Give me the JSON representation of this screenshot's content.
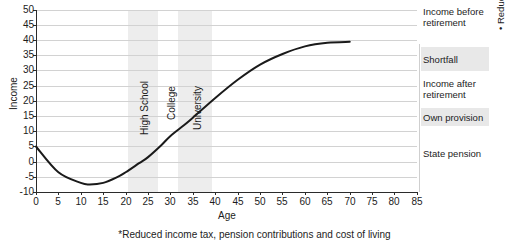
{
  "chart_data": {
    "type": "line",
    "title": "",
    "xlabel": "Age",
    "ylabel": "Income",
    "xlim": [
      0,
      85
    ],
    "ylim": [
      -10,
      50
    ],
    "xticks": [
      0,
      5,
      10,
      15,
      20,
      25,
      30,
      35,
      40,
      45,
      50,
      55,
      60,
      65,
      70,
      75,
      80,
      85
    ],
    "yticks": [
      -10,
      -5,
      0,
      5,
      10,
      15,
      20,
      25,
      30,
      35,
      40,
      45,
      50
    ],
    "grid": true,
    "legend_position": "right-outside",
    "series": [
      {
        "name": "Income over lifetime",
        "color": "#1a1a1a",
        "x": [
          0,
          5,
          10,
          12,
          15,
          18,
          20,
          23,
          25,
          28,
          30,
          33,
          35,
          40,
          45,
          50,
          55,
          60,
          65,
          70
        ],
        "y": [
          5.0,
          -3.5,
          -7.0,
          -7.5,
          -7.0,
          -5.2,
          -3.5,
          -0.5,
          1.5,
          5.5,
          8.5,
          12.0,
          14.5,
          21.0,
          27.0,
          32.0,
          35.5,
          38.0,
          39.2,
          39.5
        ]
      }
    ],
    "shaded_bands": [
      {
        "label": "High School",
        "x_start": 18,
        "x_end": 23,
        "color": "#ededed"
      },
      {
        "label": "College",
        "x_start": 23,
        "x_end": 28,
        "color": "#ffffff"
      },
      {
        "label": "University",
        "x_start": 28,
        "x_end": 33,
        "color": "#ededed"
      }
    ],
    "annotations": [
      {
        "label": "Income before retirement",
        "shaded": false
      },
      {
        "label": "Shortfall",
        "shaded": true
      },
      {
        "label": "Income after retirement",
        "shaded": false
      },
      {
        "label": "Own provision",
        "shaded": true
      },
      {
        "label": "State pension",
        "shaded": false
      }
    ],
    "side_note": "* Reduction in expenditure",
    "footnote": "*Reduced income tax, pension contributions and cost of living"
  },
  "axes": {
    "y_title": "Income",
    "x_title": "Age",
    "y_ticks": [
      "50",
      "45",
      "40",
      "35",
      "30",
      "25",
      "20",
      "15",
      "10",
      "5",
      "0",
      "-5",
      "-10"
    ],
    "x_ticks": [
      "0",
      "5",
      "10",
      "15",
      "20",
      "25",
      "30",
      "35",
      "40",
      "45",
      "50",
      "55",
      "60",
      "65",
      "70",
      "75",
      "80",
      "85"
    ]
  },
  "band_labels": {
    "high_school": "High School",
    "college": "College",
    "university": "University"
  },
  "legend": {
    "income_before": "Income before retirement",
    "shortfall": "Shortfall",
    "income_after": "Income after retirement",
    "own_provision": "Own provision",
    "state_pension": "State pension",
    "reduction_note": "• Reduction in expenditure"
  },
  "footnote": "*Reduced income tax, pension contributions and cost of living"
}
